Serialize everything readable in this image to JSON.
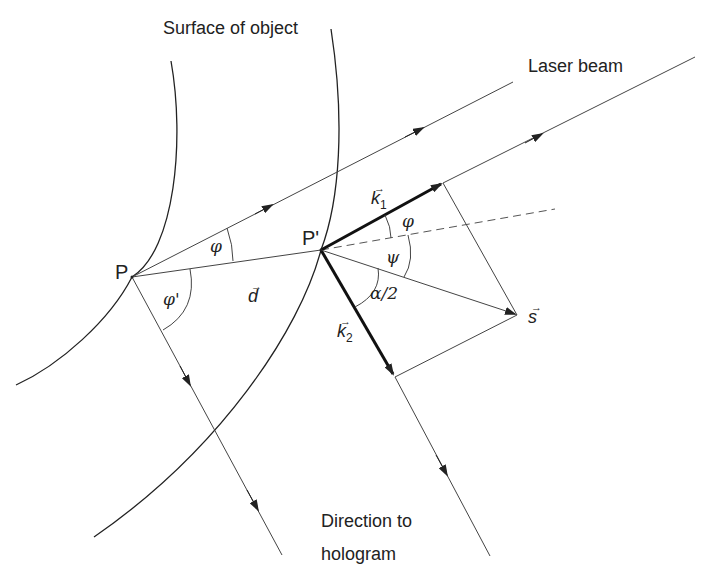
{
  "diagram": {
    "type": "optics-geometry",
    "labels": {
      "surface": "Surface of object",
      "laser": "Laser beam",
      "direction_line1": "Direction to",
      "direction_line2": "hologram",
      "point_p": "P",
      "point_p_prime": "P'",
      "vector_d": "d",
      "vector_k1": "k",
      "vector_k1_sub": "1",
      "vector_k2": "k",
      "vector_k2_sub": "2",
      "vector_s": "s",
      "vector_arrow": "→",
      "angle_phi_top": "φ",
      "angle_phi_prime": "φ'",
      "angle_phi_right": "φ",
      "angle_psi": "ψ",
      "angle_alpha_half": "α/2"
    },
    "points": {
      "P": [
        132,
        277
      ],
      "P_prime": [
        321,
        250
      ],
      "k1_tip": [
        443,
        183
      ],
      "k2_tip": [
        395,
        377
      ],
      "s_tip": [
        517,
        315
      ]
    },
    "colors": {
      "line": "#333333",
      "text": "#222222",
      "background": "#ffffff"
    }
  }
}
